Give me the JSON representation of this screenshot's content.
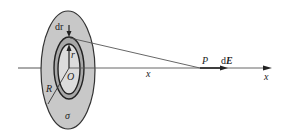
{
  "diagram": {
    "labels": {
      "dr": "dr",
      "r": "r",
      "O": "O",
      "R": "R",
      "sigma": "σ",
      "x_mid": "x",
      "P": "P",
      "dE_d": "d",
      "dE_E": "E",
      "x_axis": "x"
    },
    "colors": {
      "disk_fill": "#c8c8c8",
      "ring_fill": "#a8a8a8",
      "stroke": "#333333",
      "inner_fill": "#dcdcdc"
    }
  }
}
